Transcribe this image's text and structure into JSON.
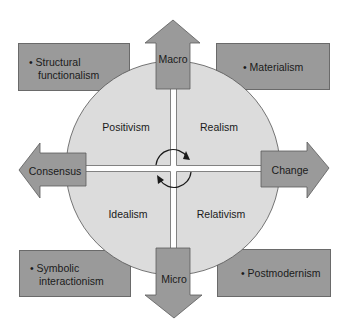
{
  "diagram": {
    "quadrants": {
      "top_left": "Positivism",
      "top_right": "Realism",
      "bottom_left": "Idealism",
      "bottom_right": "Relativism"
    },
    "arrows": {
      "up": "Macro",
      "down": "Micro",
      "left": "Consensus",
      "right": "Change"
    },
    "boxes": {
      "top_left": {
        "line1": "• Structural",
        "line2": "functionalism"
      },
      "top_right": {
        "line1": "• Materialism"
      },
      "bottom_left": {
        "line1": "• Symbolic",
        "line2": "interactionism"
      },
      "bottom_right": {
        "line1": "• Postmodernism"
      }
    },
    "center_icon": "cycle-arrows-icon",
    "colors": {
      "circle_fill": "#dcdcdc",
      "arrow_fill": "#9a9a9a",
      "box_fill": "#9a9a9a",
      "outline": "#5a5a5a"
    }
  }
}
